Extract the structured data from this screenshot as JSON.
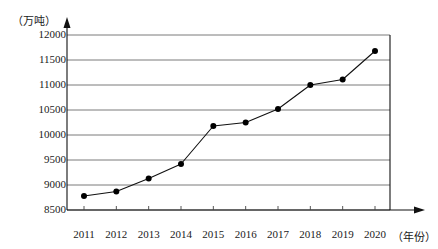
{
  "chart_data": {
    "type": "line",
    "title": "",
    "subtitle": "",
    "xlabel": "（年份）",
    "ylabel": "（万吨）",
    "categories": [
      "2011",
      "2012",
      "2013",
      "2014",
      "2015",
      "2016",
      "2017",
      "2018",
      "2019",
      "2020"
    ],
    "values": [
      8780,
      8870,
      9130,
      9420,
      10180,
      10250,
      10520,
      11000,
      11110,
      11680
    ],
    "series": [
      {
        "name": "产量",
        "values": [
          8780,
          8870,
          9130,
          9420,
          10180,
          10250,
          10520,
          11000,
          11110,
          11680
        ]
      }
    ],
    "ylim": [
      8500,
      12000
    ],
    "ytick_labels": [
      "12000",
      "11500",
      "11000",
      "10500",
      "10000",
      "9500",
      "9000",
      "8500"
    ],
    "ytick_values": [
      12000,
      11500,
      11000,
      10500,
      10000,
      9500,
      9000,
      8500
    ],
    "grid": true,
    "legend": false,
    "legend_position": "none",
    "marker": "filled-circle",
    "line_color": "#111111",
    "marker_color": "#000000",
    "grid_color": "#6b6b6b",
    "axis_color": "#111111"
  },
  "axes": {
    "y_unit_label": "（万吨）",
    "x_unit_label": "（年份）"
  }
}
